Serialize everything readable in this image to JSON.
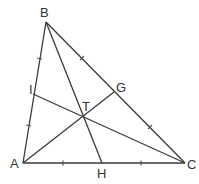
{
  "diagram": {
    "type": "triangle-geometry",
    "points": {
      "A": {
        "label": "A",
        "x": 23,
        "y": 163
      },
      "B": {
        "label": "B",
        "x": 46,
        "y": 22
      },
      "C": {
        "label": "C",
        "x": 185,
        "y": 163
      },
      "H": {
        "label": "H",
        "x": 102,
        "y": 163
      },
      "G": {
        "label": "G",
        "x": 114,
        "y": 92
      },
      "I": {
        "label": "I",
        "x": 33,
        "y": 94
      },
      "T": {
        "label": "T",
        "x": 85,
        "y": 117
      }
    },
    "segments": [
      "AB",
      "BC",
      "CA",
      "BH",
      "AG",
      "CI"
    ],
    "equal_marks": [
      "AI = IB",
      "BG = GC",
      "AH = HC"
    ]
  }
}
